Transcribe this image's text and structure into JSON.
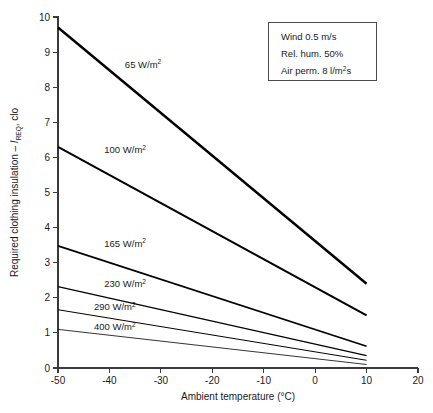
{
  "chart_data": {
    "type": "line",
    "title": "",
    "xlabel": "Ambient temperature (°C)",
    "ylabel_prefix": "Required clothing insulation – ",
    "ylabel_symbol": "I",
    "ylabel_subscript": "REQ",
    "ylabel_suffix": ", clo",
    "xlim": [
      -50,
      20
    ],
    "ylim": [
      0,
      10
    ],
    "xticks": [
      -50,
      -40,
      -30,
      -20,
      -10,
      0,
      10,
      20
    ],
    "yticks": [
      0,
      1,
      2,
      3,
      4,
      5,
      6,
      7,
      8,
      9,
      10
    ],
    "xtick_labels": [
      "-50",
      "-40",
      "-30",
      "-20",
      "-10",
      "0",
      "10",
      "20"
    ],
    "ytick_labels": [
      "0",
      "1",
      "2",
      "3",
      "4",
      "5",
      "6",
      "7",
      "8",
      "9",
      "10"
    ],
    "grid": false,
    "legend_position": "top-right",
    "series": [
      {
        "name": "65 W/m²",
        "label_value": "65",
        "label_unit": "W/m",
        "label_exp": "2",
        "x": [
          -50,
          10
        ],
        "values": [
          9.7,
          2.4
        ],
        "label_x": -37,
        "label_y": 8.55,
        "width": 2.4
      },
      {
        "name": "100 W/m²",
        "label_value": "100",
        "label_unit": "W/m",
        "label_exp": "2",
        "x": [
          -50,
          10
        ],
        "values": [
          6.3,
          1.5
        ],
        "label_x": -41,
        "label_y": 6.12,
        "width": 2.1
      },
      {
        "name": "165 W/m²",
        "label_value": "165",
        "label_unit": "W/m",
        "label_exp": "2",
        "x": [
          -50,
          10
        ],
        "values": [
          3.48,
          0.62
        ],
        "label_x": -41,
        "label_y": 3.46,
        "width": 1.7
      },
      {
        "name": "230 W/m²",
        "label_value": "230",
        "label_unit": "W/m",
        "label_exp": "2",
        "x": [
          -50,
          10
        ],
        "values": [
          2.32,
          0.35
        ],
        "label_x": -41,
        "label_y": 2.3,
        "width": 1.3
      },
      {
        "name": "290 W/m²",
        "label_value": "290",
        "label_unit": "W/m",
        "label_exp": "2",
        "x": [
          -50,
          10
        ],
        "values": [
          1.66,
          0.22
        ],
        "label_x": -43,
        "label_y": 1.65,
        "width": 1.0
      },
      {
        "name": "400 W/m²",
        "label_value": "400",
        "label_unit": "W/m",
        "label_exp": "2",
        "x": [
          -50,
          10
        ],
        "values": [
          1.1,
          0.1
        ],
        "label_x": -43,
        "label_y": 1.08,
        "width": 0.8
      }
    ],
    "annotations": {
      "legend_lines": [
        {
          "text": "Wind 0.5 m/s",
          "sup": ""
        },
        {
          "text": "Rel. hum. 50%",
          "sup": ""
        },
        {
          "text": "Air perm. 8 l/m",
          "sup": "2",
          "tail": "s"
        }
      ]
    }
  },
  "colors": {
    "axis": "#3a3a3a",
    "line": "#000000",
    "text": "#1a1a1a",
    "legend_border": "#4a4a4a",
    "background": "#ffffff"
  }
}
